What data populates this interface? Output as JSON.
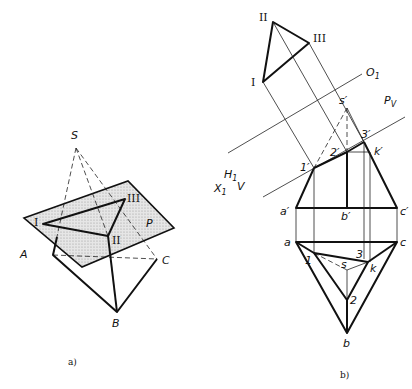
{
  "figure_a": {
    "caption": "a)",
    "labels": {
      "S": "S",
      "A": "A",
      "B": "B",
      "C": "C",
      "P": "P",
      "I": "I",
      "II": "II",
      "III": "III"
    }
  },
  "figure_b": {
    "caption": "b)",
    "labels": {
      "I": "I",
      "II": "II",
      "III": "III",
      "O1": "O",
      "O1_sub": "1",
      "H1": "H",
      "H1_sub": "1",
      "X1": "X",
      "X1_sub": "1",
      "V": "V",
      "Pv": "P",
      "Pv_sub": "V",
      "s_prime": "s′",
      "one_prime": "1′",
      "two_prime": "2′",
      "three_prime": "3′",
      "k_prime": "k′",
      "a_prime": "a′",
      "b_prime": "b′",
      "c_prime": "c′",
      "a": "a",
      "b": "b",
      "c": "c",
      "s": "s",
      "k": "k",
      "one": "1",
      "two": "2",
      "three": "3"
    }
  },
  "colors": {
    "line": "#111111",
    "plane_fill": "#d9d9d9"
  }
}
